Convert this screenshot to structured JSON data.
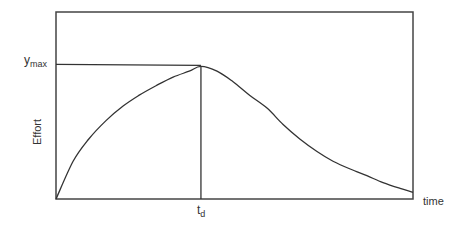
{
  "chart_data": {
    "type": "line",
    "title": "",
    "xlabel": "time",
    "ylabel": "Effort",
    "xlim": [
      0,
      1
    ],
    "ylim": [
      0,
      1.39
    ],
    "grid": false,
    "annotations": {
      "ymax_label": "y",
      "ymax_subscript": "max",
      "ymax_value": 1.0,
      "td_label": "t",
      "td_subscript": "d",
      "td_value": 0.406
    },
    "series": [
      {
        "name": "effort",
        "x": [
          0,
          0.048,
          0.092,
          0.14,
          0.188,
          0.232,
          0.28,
          0.328,
          0.373,
          0.406,
          0.451,
          0.496,
          0.543,
          0.591,
          0.636,
          0.683,
          0.731,
          0.776,
          0.824,
          0.871,
          0.916,
          0.964,
          1.0
        ],
        "y": [
          0,
          0.28,
          0.446,
          0.583,
          0.691,
          0.77,
          0.842,
          0.906,
          0.95,
          0.986,
          0.95,
          0.871,
          0.77,
          0.676,
          0.554,
          0.446,
          0.353,
          0.281,
          0.223,
          0.173,
          0.122,
          0.079,
          0.05
        ]
      }
    ],
    "colors": {
      "line": "#333333",
      "frame": "#444444"
    }
  }
}
